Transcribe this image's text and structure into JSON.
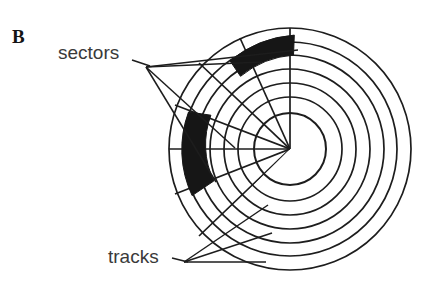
{
  "figure": {
    "panel_letter": "B",
    "background_color": "#ffffff",
    "ink_color": "#1d1d1d"
  },
  "labels": {
    "sectors": "sectors",
    "tracks": "tracks"
  },
  "diagram": {
    "center": {
      "x": 290,
      "y": 149
    },
    "hub_radius": 36,
    "track_radii": [
      52,
      66,
      80,
      94,
      107,
      121
    ],
    "outer_radius": 121,
    "track_count": 7,
    "sector_divider_angles_deg": [
      270,
      292,
      315,
      337,
      180,
      202,
      225,
      247
    ],
    "highlighted_sectors": [
      {
        "name": "sector-highlight-top",
        "start_angle_deg": 238,
        "end_angle_deg": 272,
        "inner_radius": 94,
        "outer_radius": 114,
        "fill": "#161616"
      },
      {
        "name": "sector-highlight-left",
        "start_angle_deg": 160,
        "end_angle_deg": 205,
        "inner_radius": 48,
        "outer_radius": 108,
        "fill": "#161616"
      }
    ],
    "leader_lines": {
      "sectors_origin": {
        "x": 146,
        "y": 67
      },
      "tracks_origin": {
        "x": 184,
        "y": 262
      }
    }
  }
}
